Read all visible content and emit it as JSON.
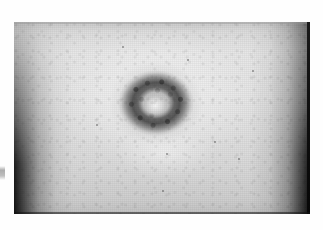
{
  "figure": {
    "kind": "clinical-photograph",
    "medium": "halftone print, grayscale",
    "caption": "",
    "subject": {
      "region": "trunk / abdomen",
      "lesion_type": "annular lesion",
      "lesion_description": "ring-shaped darker mottled rim with pale central clearing",
      "lesion_count": "1"
    }
  },
  "plate": {
    "label": "photograph-plate",
    "frame_left_px": "14",
    "frame_top_px": "22",
    "frame_width_px": "296",
    "frame_height_px": "192",
    "background_tone": "#e3e3e3",
    "edge_shadow_tone": "#0a0a0a",
    "skin_tone_light": "#ececec",
    "skin_tone_mid": "#d9d9d9",
    "skin_tone_dark": "#c0c0c0"
  },
  "lesion": {
    "label": "annular-lesion",
    "center_x_px": "156",
    "center_y_px": "103",
    "outer_width_px": "76",
    "outer_height_px": "66",
    "rim_tone": "#4a4a4a",
    "center_tone": "#f2f2f2",
    "halo_tone": "#9a9a9a"
  },
  "annotations": {
    "margin_mark": "stray ink mark in left page margin",
    "page_background": "#ffffff"
  },
  "specks": [
    {
      "x": "122",
      "y": "46",
      "d": "2"
    },
    {
      "x": "187",
      "y": "59",
      "d": "2"
    },
    {
      "x": "252",
      "y": "70",
      "d": "2"
    },
    {
      "x": "214",
      "y": "141",
      "d": "2"
    },
    {
      "x": "166",
      "y": "153",
      "d": "2"
    },
    {
      "x": "162",
      "y": "190",
      "d": "2"
    },
    {
      "x": "238",
      "y": "158",
      "d": "2"
    },
    {
      "x": "96",
      "y": "124",
      "d": "2"
    }
  ]
}
